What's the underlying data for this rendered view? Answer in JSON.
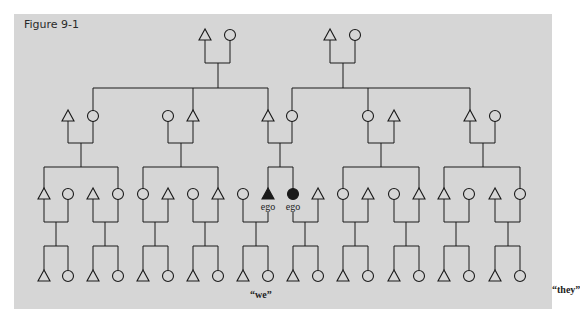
{
  "figure": {
    "title": "Figure 9-1",
    "background_color": "#d6d6d6",
    "line_color": "#1a1a1a",
    "labels": {
      "ego": "ego",
      "we": "“we”",
      "they": "“they”"
    }
  },
  "generations": [
    {
      "level": 0,
      "y": 35,
      "members": [
        {
          "x": 205,
          "sex": "male"
        },
        {
          "x": 230,
          "sex": "female"
        },
        {
          "x": 330,
          "sex": "male"
        },
        {
          "x": 355,
          "sex": "female"
        }
      ]
    },
    {
      "level": 1,
      "y": 116,
      "members": [
        {
          "x": 68,
          "sex": "male"
        },
        {
          "x": 93,
          "sex": "female"
        },
        {
          "x": 168,
          "sex": "female"
        },
        {
          "x": 193,
          "sex": "male"
        },
        {
          "x": 268,
          "sex": "male"
        },
        {
          "x": 292,
          "sex": "female"
        },
        {
          "x": 368,
          "sex": "female"
        },
        {
          "x": 394,
          "sex": "male"
        },
        {
          "x": 470,
          "sex": "male"
        },
        {
          "x": 495,
          "sex": "female"
        }
      ]
    },
    {
      "level": 2,
      "y": 194,
      "members": [
        {
          "x": 44,
          "sex": "male"
        },
        {
          "x": 68,
          "sex": "female"
        },
        {
          "x": 93,
          "sex": "male"
        },
        {
          "x": 118,
          "sex": "female"
        },
        {
          "x": 143,
          "sex": "female"
        },
        {
          "x": 168,
          "sex": "male"
        },
        {
          "x": 193,
          "sex": "female"
        },
        {
          "x": 218,
          "sex": "male"
        },
        {
          "x": 243,
          "sex": "female"
        },
        {
          "x": 268,
          "sex": "male",
          "ego": true
        },
        {
          "x": 293,
          "sex": "female",
          "ego": true
        },
        {
          "x": 318,
          "sex": "male"
        },
        {
          "x": 343,
          "sex": "female"
        },
        {
          "x": 368,
          "sex": "male"
        },
        {
          "x": 394,
          "sex": "female"
        },
        {
          "x": 419,
          "sex": "male"
        },
        {
          "x": 444,
          "sex": "male"
        },
        {
          "x": 469,
          "sex": "female"
        },
        {
          "x": 495,
          "sex": "male"
        },
        {
          "x": 520,
          "sex": "female"
        }
      ]
    },
    {
      "level": 3,
      "y": 276,
      "members": [
        {
          "x": 44,
          "sex": "male"
        },
        {
          "x": 68,
          "sex": "female"
        },
        {
          "x": 93,
          "sex": "male"
        },
        {
          "x": 118,
          "sex": "female"
        },
        {
          "x": 143,
          "sex": "male"
        },
        {
          "x": 168,
          "sex": "female"
        },
        {
          "x": 193,
          "sex": "male"
        },
        {
          "x": 218,
          "sex": "female"
        },
        {
          "x": 243,
          "sex": "male"
        },
        {
          "x": 268,
          "sex": "female"
        },
        {
          "x": 293,
          "sex": "male"
        },
        {
          "x": 318,
          "sex": "female"
        },
        {
          "x": 343,
          "sex": "male"
        },
        {
          "x": 368,
          "sex": "female"
        },
        {
          "x": 394,
          "sex": "male"
        },
        {
          "x": 419,
          "sex": "female"
        },
        {
          "x": 444,
          "sex": "male"
        },
        {
          "x": 469,
          "sex": "female"
        },
        {
          "x": 495,
          "sex": "male"
        },
        {
          "x": 520,
          "sex": "female"
        }
      ]
    }
  ],
  "lines": [
    [
      205,
      40,
      205,
      63
    ],
    [
      230,
      40,
      230,
      63
    ],
    [
      205,
      63,
      230,
      63
    ],
    [
      218,
      63,
      218,
      88
    ],
    [
      330,
      40,
      330,
      63
    ],
    [
      355,
      40,
      355,
      63
    ],
    [
      330,
      63,
      355,
      63
    ],
    [
      343,
      63,
      343,
      88
    ],
    [
      93,
      88,
      268,
      88
    ],
    [
      93,
      88,
      93,
      111
    ],
    [
      193,
      88,
      193,
      111
    ],
    [
      268,
      88,
      268,
      111
    ],
    [
      292,
      88,
      470,
      88
    ],
    [
      292,
      88,
      292,
      111
    ],
    [
      368,
      88,
      368,
      111
    ],
    [
      470,
      88,
      470,
      111
    ],
    [
      68,
      121,
      68,
      143
    ],
    [
      93,
      121,
      93,
      143
    ],
    [
      68,
      143,
      93,
      143
    ],
    [
      81,
      143,
      81,
      167
    ],
    [
      168,
      121,
      168,
      143
    ],
    [
      193,
      121,
      193,
      143
    ],
    [
      168,
      143,
      193,
      143
    ],
    [
      181,
      143,
      181,
      167
    ],
    [
      268,
      121,
      268,
      143
    ],
    [
      292,
      121,
      292,
      143
    ],
    [
      268,
      143,
      292,
      143
    ],
    [
      280,
      143,
      280,
      167
    ],
    [
      368,
      121,
      368,
      143
    ],
    [
      394,
      121,
      394,
      143
    ],
    [
      368,
      143,
      394,
      143
    ],
    [
      381,
      143,
      381,
      167
    ],
    [
      470,
      121,
      470,
      143
    ],
    [
      495,
      121,
      495,
      143
    ],
    [
      470,
      143,
      495,
      143
    ],
    [
      483,
      143,
      483,
      167
    ],
    [
      44,
      167,
      118,
      167
    ],
    [
      44,
      167,
      44,
      189
    ],
    [
      118,
      167,
      118,
      189
    ],
    [
      143,
      167,
      218,
      167
    ],
    [
      143,
      167,
      143,
      189
    ],
    [
      218,
      167,
      218,
      189
    ],
    [
      268,
      167,
      293,
      167
    ],
    [
      268,
      167,
      268,
      189
    ],
    [
      293,
      167,
      293,
      189
    ],
    [
      343,
      167,
      419,
      167
    ],
    [
      343,
      167,
      343,
      189
    ],
    [
      419,
      167,
      419,
      189
    ],
    [
      444,
      167,
      520,
      167
    ],
    [
      444,
      167,
      444,
      189
    ],
    [
      520,
      167,
      520,
      189
    ],
    [
      44,
      199,
      44,
      222
    ],
    [
      68,
      199,
      68,
      222
    ],
    [
      44,
      222,
      68,
      222
    ],
    [
      56,
      222,
      56,
      246
    ],
    [
      93,
      199,
      93,
      222
    ],
    [
      118,
      199,
      118,
      222
    ],
    [
      93,
      222,
      118,
      222
    ],
    [
      105,
      222,
      105,
      246
    ],
    [
      143,
      199,
      143,
      222
    ],
    [
      168,
      199,
      168,
      222
    ],
    [
      143,
      222,
      168,
      222
    ],
    [
      155,
      222,
      155,
      246
    ],
    [
      193,
      199,
      193,
      222
    ],
    [
      218,
      199,
      218,
      222
    ],
    [
      193,
      222,
      218,
      222
    ],
    [
      205,
      222,
      205,
      246
    ],
    [
      243,
      199,
      243,
      222
    ],
    [
      268,
      212,
      268,
      222
    ],
    [
      243,
      222,
      268,
      222
    ],
    [
      256,
      222,
      256,
      246
    ],
    [
      293,
      212,
      293,
      222
    ],
    [
      318,
      199,
      318,
      222
    ],
    [
      293,
      222,
      318,
      222
    ],
    [
      305,
      222,
      305,
      246
    ],
    [
      343,
      199,
      343,
      222
    ],
    [
      368,
      199,
      368,
      222
    ],
    [
      343,
      222,
      368,
      222
    ],
    [
      355,
      222,
      355,
      246
    ],
    [
      394,
      199,
      394,
      222
    ],
    [
      419,
      199,
      419,
      222
    ],
    [
      394,
      222,
      419,
      222
    ],
    [
      406,
      222,
      406,
      246
    ],
    [
      444,
      199,
      444,
      222
    ],
    [
      469,
      199,
      469,
      222
    ],
    [
      444,
      222,
      469,
      222
    ],
    [
      456,
      222,
      456,
      246
    ],
    [
      495,
      199,
      495,
      222
    ],
    [
      520,
      199,
      520,
      222
    ],
    [
      495,
      222,
      520,
      222
    ],
    [
      508,
      222,
      508,
      246
    ],
    [
      44,
      246,
      68,
      246
    ],
    [
      44,
      246,
      44,
      270
    ],
    [
      68,
      246,
      68,
      270
    ],
    [
      93,
      246,
      118,
      246
    ],
    [
      93,
      246,
      93,
      270
    ],
    [
      118,
      246,
      118,
      270
    ],
    [
      143,
      246,
      168,
      246
    ],
    [
      143,
      246,
      143,
      270
    ],
    [
      168,
      246,
      168,
      270
    ],
    [
      193,
      246,
      218,
      246
    ],
    [
      193,
      246,
      193,
      270
    ],
    [
      218,
      246,
      218,
      270
    ],
    [
      243,
      246,
      268,
      246
    ],
    [
      243,
      246,
      243,
      270
    ],
    [
      268,
      246,
      268,
      270
    ],
    [
      293,
      246,
      318,
      246
    ],
    [
      293,
      246,
      293,
      270
    ],
    [
      318,
      246,
      318,
      270
    ],
    [
      343,
      246,
      368,
      246
    ],
    [
      343,
      246,
      343,
      270
    ],
    [
      368,
      246,
      368,
      270
    ],
    [
      394,
      246,
      419,
      246
    ],
    [
      394,
      246,
      394,
      270
    ],
    [
      419,
      246,
      419,
      270
    ],
    [
      444,
      246,
      469,
      246
    ],
    [
      444,
      246,
      444,
      270
    ],
    [
      469,
      246,
      469,
      270
    ],
    [
      495,
      246,
      520,
      246
    ],
    [
      495,
      246,
      495,
      270
    ],
    [
      520,
      246,
      520,
      270
    ]
  ]
}
